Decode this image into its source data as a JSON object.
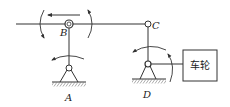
{
  "diagram": {
    "type": "mechanism-linkage",
    "colors": {
      "stroke": "#333333",
      "background": "#ffffff"
    },
    "joints": {
      "A": {
        "label": "A",
        "kind": "ground-pivot"
      },
      "B": {
        "label": "B",
        "kind": "pin"
      },
      "C": {
        "label": "C",
        "kind": "pin"
      },
      "D": {
        "label": "D",
        "kind": "ground-pivot"
      }
    },
    "box": {
      "label": "车轮"
    },
    "arrows": [
      {
        "name": "arrow-left-translation",
        "direction": "left"
      },
      {
        "name": "arrow-rotation-ccw-left-of-B",
        "direction": "counter-clockwise"
      },
      {
        "name": "arrow-rotation-cw-right-of-B",
        "direction": "clockwise"
      },
      {
        "name": "arrow-rotation-above-A",
        "direction": "counter-clockwise"
      },
      {
        "name": "arrow-rotation-above-D",
        "direction": "counter-clockwise"
      },
      {
        "name": "arrow-rotation-right-of-D",
        "direction": "clockwise"
      }
    ]
  }
}
